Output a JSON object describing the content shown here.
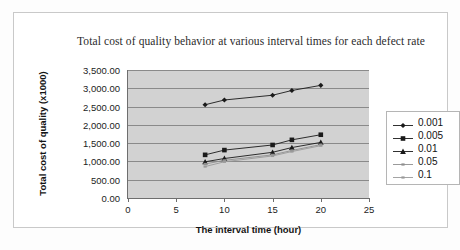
{
  "chart_data": {
    "type": "line",
    "title": "Total cost of quality behavior at various interval times for each defect rate",
    "xlabel": "The interval time (hour)",
    "ylabel": "Total cost of quality (x1000)",
    "xlim": [
      0,
      25
    ],
    "ylim": [
      0,
      3500
    ],
    "xticks": [
      "0",
      "5",
      "10",
      "15",
      "20",
      "25"
    ],
    "xtick_values": [
      0,
      5,
      10,
      15,
      20,
      25
    ],
    "yticks": [
      "0.00",
      "500.00",
      "1,000.00",
      "1,500.00",
      "2,000.00",
      "2,500.00",
      "3,000.00",
      "3,500.00"
    ],
    "ytick_values": [
      0,
      500,
      1000,
      1500,
      2000,
      2500,
      3000,
      3500
    ],
    "grid": "horizontal",
    "legend_position": "right",
    "plot_background": "#d2d2d2",
    "x": [
      8,
      10,
      15,
      17,
      20
    ],
    "series": [
      {
        "name": "0.001",
        "marker": "diamond",
        "color": "#1a1a1a",
        "values": [
          2550,
          2680,
          2810,
          2940,
          3080
        ]
      },
      {
        "name": "0.005",
        "marker": "square",
        "color": "#1a1a1a",
        "values": [
          1180,
          1310,
          1450,
          1590,
          1730
        ]
      },
      {
        "name": "0.01",
        "marker": "triangle",
        "color": "#1a1a1a",
        "values": [
          990,
          1080,
          1250,
          1380,
          1520
        ]
      },
      {
        "name": "0.05",
        "marker": "line",
        "color": "#8f8f8f",
        "values": [
          930,
          1030,
          1180,
          1300,
          1460
        ]
      },
      {
        "name": "0.1",
        "marker": "line",
        "color": "#9a9a9a",
        "values": [
          860,
          990,
          1150,
          1270,
          1430
        ]
      }
    ]
  }
}
